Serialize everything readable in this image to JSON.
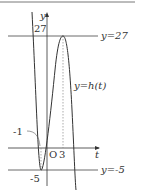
{
  "diagram": {
    "axes": {
      "x_label": "t",
      "y_label": "y",
      "origin_label": "O"
    },
    "ticks": {
      "y_top": "27",
      "y_bottom": "-5",
      "t_left": "-1",
      "t_right": "3"
    },
    "lines": {
      "upper": "y=27",
      "lower": "y=-5"
    },
    "curve_label": "y=h(t)",
    "colors": {
      "stroke": "#333333",
      "guide": "#888888"
    }
  }
}
